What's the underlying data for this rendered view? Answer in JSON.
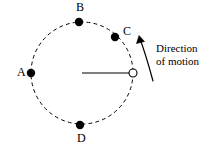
{
  "figure": {
    "background_color": "#ffffff",
    "stroke_color": "#000000",
    "width": 206,
    "height": 149
  },
  "orbit": {
    "name": "dashed-circular-path",
    "center_x": 82,
    "center_y": 73,
    "radius": 51,
    "style": "dashed",
    "dash_pattern": "3 4"
  },
  "radius_line": {
    "name": "radius-line",
    "from_x": 82,
    "from_y": 73,
    "to_x": 133,
    "to_y": 73
  },
  "object_marker": {
    "name": "open-circle-object",
    "x": 133,
    "y": 73,
    "radius": 4,
    "fill": "#ffffff"
  },
  "points": [
    {
      "label": "A",
      "dot_x": 31,
      "dot_y": 73,
      "dot_r": 4.2,
      "label_x": 17,
      "label_y": 67
    },
    {
      "label": "B",
      "dot_x": 79,
      "dot_y": 22,
      "dot_r": 4.2,
      "label_x": 76,
      "label_y": 2
    },
    {
      "label": "C",
      "dot_x": 115,
      "dot_y": 37,
      "dot_r": 4.2,
      "label_x": 123,
      "label_y": 26
    },
    {
      "label": "D",
      "dot_x": 80,
      "dot_y": 125,
      "dot_r": 4.2,
      "label_x": 77,
      "label_y": 133
    }
  ],
  "direction_arrow": {
    "name": "direction-of-motion-arrow",
    "path": "M 153,81 C 150,70 145,52 140,39",
    "arrow_tip_x": 139,
    "arrow_tip_y": 36
  },
  "caption": {
    "line1": "Direction",
    "line2": "of motion",
    "x": 156,
    "y": 43
  }
}
